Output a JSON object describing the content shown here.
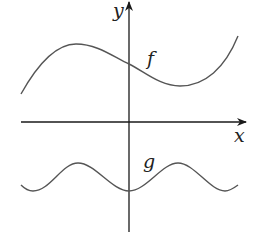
{
  "diagram": {
    "title": "",
    "axes": {
      "x_label": "x",
      "y_label": "y"
    },
    "curves": [
      {
        "name": "f",
        "label": "f",
        "shape": "cubic-like: rises to local max left of y-axis, dips to local min right of y-axis, rises again"
      },
      {
        "name": "g",
        "label": "g",
        "shape": "periodic wave below x-axis with minimum on the y-axis"
      }
    ],
    "colors": {
      "curve": "#555555",
      "axis": "#1a1a1a",
      "background": "#ffffff"
    }
  }
}
